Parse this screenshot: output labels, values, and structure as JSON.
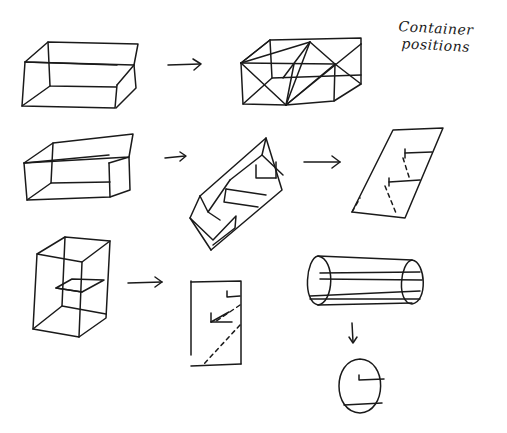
{
  "page": {
    "width": 507,
    "height": 433,
    "background": "#ffffff",
    "ink": "#1a1a1a"
  },
  "annotation": {
    "line1": "Container",
    "line2": "positions",
    "x": 398,
    "y": 20
  },
  "figures": [
    {
      "name": "box-horizontal",
      "paths": [
        "M25 62 L48 42 L138 44 L134 65 Z",
        "M25 62 L22 106 L115 108 L117 85",
        "M117 85 L134 65",
        "M48 42 L50 86 L116 87",
        "M50 86 L22 106",
        "M25 62 L117 65",
        "M134 65 L136 88 L116 108"
      ],
      "dashed": []
    },
    {
      "name": "arrow-1",
      "paths": [
        "M168 65 L200 64",
        "M193 59 L201 64 L194 70"
      ],
      "dashed": []
    },
    {
      "name": "box-horizontal-triangulated",
      "paths": [
        "M241 63 L270 40 L361 38 L361 44",
        "M241 63 L243 104 L286 105 L334 101 L361 84 L361 44",
        "M270 40 L272 78",
        "M241 63 L335 64 L361 84",
        "M241 63 L286 105",
        "M241 63 L310 42",
        "M310 42 L286 105",
        "M310 42 L335 64",
        "M310 42 L283 78",
        "M286 105 L335 64",
        "M286 105 L361 44",
        "M286 105 L294 64",
        "M270 40 L241 63",
        "M243 104 L272 78 L361 75",
        "M334 101 L335 64"
      ],
      "dashed": []
    },
    {
      "name": "box-tilted",
      "paths": [
        "M24 163 L53 143 L133 134 L129 157 Z",
        "M24 163 L27 200 L110 197 L109 163",
        "M109 163 L129 157 L130 190 L110 197",
        "M53 143 L51 183 L110 182",
        "M51 183 L27 200",
        "M24 163 L109 155"
      ],
      "dashed": []
    },
    {
      "name": "arrow-2",
      "paths": [
        "M165 158 L185 156",
        "M180 152 L186 156 L180 161"
      ],
      "dashed": []
    },
    {
      "name": "box-rotated-on-edge",
      "paths": [
        "M200 196 L266 138 L282 190 L211 250",
        "M200 196 L190 218 L211 250",
        "M200 196 L208 212 L230 180",
        "M266 138 L262 155 L283 175",
        "M262 155 L230 180",
        "M190 218 L213 240 L236 216 L235 228 L213 245",
        "M226 189 L224 202 L258 207",
        "M226 189 L266 195",
        "M256 165 L256 178 L276 178",
        "M276 178 L276 162",
        "M208 212 L220 220"
      ],
      "dashed": []
    },
    {
      "name": "arrow-3",
      "paths": [
        "M304 162 L340 162",
        "M332 156 L340 162 L332 168"
      ],
      "dashed": []
    },
    {
      "name": "plane-sheared",
      "paths": [
        "M393 130 L443 128 L405 218 L352 212 Z",
        "M405 153 L432 152",
        "M405 149 L405 158",
        "M389 182 L420 180",
        "M389 178 L389 186"
      ],
      "dashed": [
        "M403 158 L410 180",
        "M385 186 L396 213",
        "M352 212 L360 198"
      ]
    },
    {
      "name": "box-tall",
      "paths": [
        "M37 254 L65 237 L110 241 L82 262 Z",
        "M37 254 L33 329 L79 337 L82 262",
        "M110 241 L106 318 L79 337",
        "M65 237 L62 306 L106 314",
        "M62 306 L33 329",
        "M56 288 L72 279 L104 280 L82 292 Z",
        "M56 288 L82 292"
      ],
      "dashed": []
    },
    {
      "name": "arrow-4",
      "paths": [
        "M128 283 L162 282",
        "M155 277 L162 282 L155 287"
      ],
      "dashed": []
    },
    {
      "name": "rect-front-view",
      "paths": [
        "M191 281 L191 355",
        "M191 282 L241 281 L241 364",
        "M191 366 L241 364",
        "M227 291 L227 297 L240 296",
        "M211 322 L229 312",
        "M211 322 L232 322",
        "M211 313 L211 322"
      ],
      "dashed": [
        "M240 305 L215 322",
        "M240 325 L203 365"
      ]
    },
    {
      "name": "cylinder",
      "paths": [
        "M318 256 C306 258 302 302 318 305 C334 303 336 259 318 256 Z",
        "M318 256 L412 260",
        "M318 305 L412 303",
        "M412 260 C400 262 396 303 412 304 C428 302 426 262 412 260 Z",
        "M320 273 L420 272",
        "M320 279 L422 280",
        "M310 296 L420 291",
        "M310 299 L420 299"
      ],
      "dashed": []
    },
    {
      "name": "arrow-down",
      "paths": [
        "M352 323 L353 342",
        "M349 337 L353 343 L357 337"
      ],
      "dashed": []
    },
    {
      "name": "circle-front-view",
      "paths": [
        "M360 359 C332 360 332 412 360 413 C387 412 388 360 360 359 Z",
        "M359 375 L359 380 L384 379",
        "M344 405 L382 403"
      ],
      "dashed": []
    }
  ]
}
